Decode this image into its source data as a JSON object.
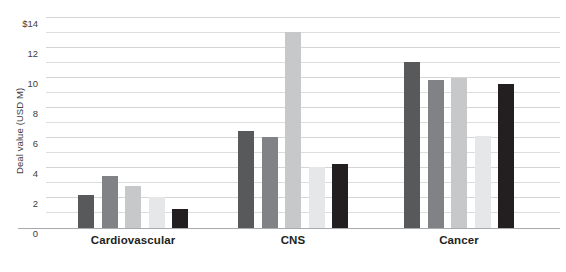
{
  "chart_data": {
    "type": "bar",
    "title": "",
    "subtitle": "",
    "xlabel": "",
    "ylabel": "Deal value (USD M)",
    "ylim": [
      0,
      14
    ],
    "ytick_step": 2,
    "gridline_step": 1,
    "grid": true,
    "legend": "none",
    "categories": [
      "Cardiovascular",
      "CNS",
      "Cancer"
    ],
    "ytick_labels": [
      "0",
      "2",
      "4",
      "6",
      "8",
      "10",
      "12",
      "$14"
    ],
    "ytick_values": [
      0,
      2,
      4,
      6,
      8,
      10,
      12,
      14
    ],
    "series": [
      {
        "name": "Series 1",
        "color": "#58595b",
        "values": [
          2.2,
          6.5,
          11.1
        ]
      },
      {
        "name": "Series 2",
        "color": "#808285",
        "values": [
          3.45,
          6.05,
          9.9
        ]
      },
      {
        "name": "Series 3",
        "color": "#c7c8ca",
        "values": [
          2.8,
          13.1,
          10.0
        ]
      },
      {
        "name": "Series 4",
        "color": "#e6e7e8",
        "values": [
          2.1,
          4.05,
          6.15
        ]
      },
      {
        "name": "Series 5",
        "color": "#231f20",
        "values": [
          1.25,
          4.25,
          9.6
        ]
      }
    ]
  },
  "colors": {
    "background": "#ffffff",
    "gridline": "#dcdddf",
    "axis_line": "#a7a9ac",
    "tick_text": "#414042",
    "category_text": "#231f20"
  }
}
